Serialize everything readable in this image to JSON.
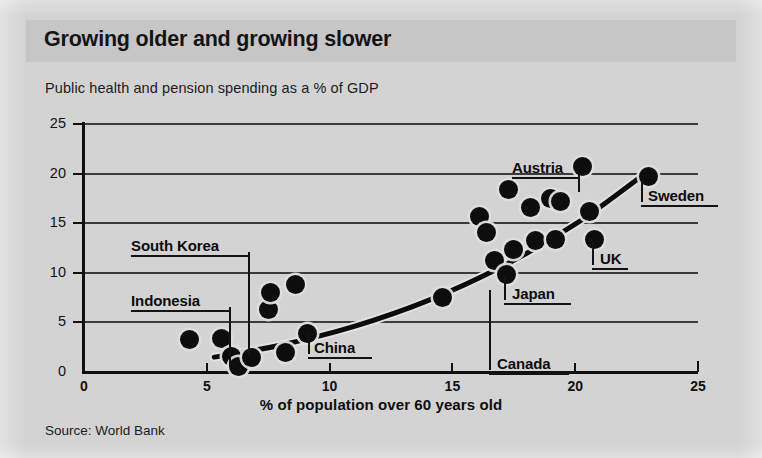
{
  "header": {
    "title": "Growing older and growing slower"
  },
  "subtitle": "Public health and pension spending as a % of GDP",
  "source": "Source: World Bank",
  "colors": {
    "background": "#d3d3d3",
    "header_band": "#c6c6c6",
    "ink": "#111111",
    "gridline": "#3b3b3b",
    "marker": "#0d0d0d",
    "marker_halo": "#dedede"
  },
  "chart_data": {
    "type": "scatter",
    "title": "Growing older and growing slower",
    "subtitle": "Public health and pension spending as a % of GDP",
    "xlabel": "% of population over 60 years old",
    "ylabel": "Public health and pension spending as a % of GDP",
    "xlim": [
      0,
      25
    ],
    "ylim": [
      0,
      25
    ],
    "xticks": [
      0,
      5,
      10,
      15,
      20,
      25
    ],
    "yticks": [
      0,
      5,
      10,
      15,
      20,
      25
    ],
    "xticklabels": [
      "0",
      "5",
      "10",
      "15",
      "20",
      "25"
    ],
    "yticklabels": [
      "0",
      "5",
      "10",
      "15",
      "20",
      "25"
    ],
    "grid": "horizontal",
    "legend": "none",
    "source": "Source: World Bank",
    "points": [
      {
        "x": 4.3,
        "y": 3.3,
        "label": ""
      },
      {
        "x": 5.6,
        "y": 3.4,
        "label": ""
      },
      {
        "x": 6.0,
        "y": 1.6,
        "label": ""
      },
      {
        "x": 6.3,
        "y": 0.6,
        "label": "Indonesia"
      },
      {
        "x": 6.8,
        "y": 1.5,
        "label": "South Korea"
      },
      {
        "x": 7.5,
        "y": 6.3,
        "label": ""
      },
      {
        "x": 7.6,
        "y": 8.0,
        "label": ""
      },
      {
        "x": 8.6,
        "y": 8.8,
        "label": ""
      },
      {
        "x": 8.2,
        "y": 2.0,
        "label": ""
      },
      {
        "x": 9.1,
        "y": 3.9,
        "label": "China"
      },
      {
        "x": 14.6,
        "y": 7.5,
        "label": ""
      },
      {
        "x": 16.1,
        "y": 15.7,
        "label": ""
      },
      {
        "x": 16.4,
        "y": 14.1,
        "label": ""
      },
      {
        "x": 16.7,
        "y": 11.2,
        "label": "Canada"
      },
      {
        "x": 17.2,
        "y": 9.8,
        "label": "Japan"
      },
      {
        "x": 17.3,
        "y": 18.4,
        "label": ""
      },
      {
        "x": 17.5,
        "y": 12.3,
        "label": ""
      },
      {
        "x": 18.2,
        "y": 16.6,
        "label": ""
      },
      {
        "x": 18.4,
        "y": 13.3,
        "label": ""
      },
      {
        "x": 19.0,
        "y": 17.5,
        "label": ""
      },
      {
        "x": 19.2,
        "y": 13.4,
        "label": ""
      },
      {
        "x": 19.4,
        "y": 17.2,
        "label": ""
      },
      {
        "x": 20.3,
        "y": 20.7,
        "label": "Austria"
      },
      {
        "x": 20.6,
        "y": 16.2,
        "label": ""
      },
      {
        "x": 20.8,
        "y": 13.4,
        "label": "UK"
      },
      {
        "x": 23.0,
        "y": 19.7,
        "label": "Sweden"
      }
    ],
    "trendline": {
      "type": "curve",
      "description": "fitted upward-curving trend line",
      "points": [
        {
          "x": 5.3,
          "y": 1.5
        },
        {
          "x": 8.0,
          "y": 2.7
        },
        {
          "x": 11.0,
          "y": 4.6
        },
        {
          "x": 14.0,
          "y": 7.2
        },
        {
          "x": 17.0,
          "y": 10.6
        },
        {
          "x": 20.0,
          "y": 14.9
        },
        {
          "x": 23.0,
          "y": 20.3
        }
      ]
    },
    "annotations": [
      {
        "label": "South Korea",
        "target_x": 6.8,
        "target_y": 1.5
      },
      {
        "label": "Indonesia",
        "target_x": 6.3,
        "target_y": 0.6
      },
      {
        "label": "China",
        "target_x": 9.1,
        "target_y": 3.9
      },
      {
        "label": "Canada",
        "target_x": 16.7,
        "target_y": 11.2
      },
      {
        "label": "Japan",
        "target_x": 17.2,
        "target_y": 9.8
      },
      {
        "label": "Austria",
        "target_x": 20.3,
        "target_y": 20.7
      },
      {
        "label": "UK",
        "target_x": 20.8,
        "target_y": 13.4
      },
      {
        "label": "Sweden",
        "target_x": 23.0,
        "target_y": 19.7
      }
    ]
  }
}
